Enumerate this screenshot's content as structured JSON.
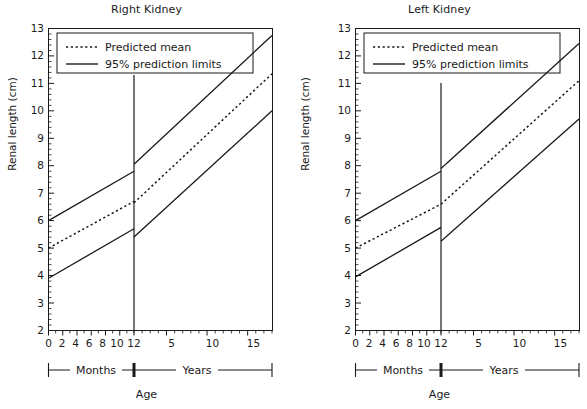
{
  "figure": {
    "xlabel": "Age",
    "ylabel": "Renal length (cm)",
    "bracket_left_label": "Months",
    "bracket_right_label": "Years"
  },
  "legend": {
    "mean_label": "Predicted mean",
    "limits_label": "95% prediction limits",
    "mean_style": "dotted",
    "limits_style": "solid",
    "color": "#1a1a1a"
  },
  "axis": {
    "y_ticks": [
      "13",
      "12",
      "11",
      "10",
      "9",
      "8",
      "7",
      "6",
      "5",
      "4",
      "3",
      "2"
    ],
    "x_ticks_months": [
      "0",
      "2",
      "4",
      "6",
      "8",
      "10",
      "12"
    ],
    "x_ticks_years": [
      "5",
      "10",
      "15"
    ]
  },
  "chart_data": [
    {
      "type": "line",
      "title": "Right Kidney",
      "xlabel": "Age",
      "ylabel": "Renal length (cm)",
      "ylim": [
        2,
        13
      ],
      "xlim_months": [
        0,
        12
      ],
      "xlim_years": [
        1,
        18
      ],
      "grid": false,
      "legend_position": "top-left",
      "annotations": [
        "Months",
        "Years"
      ],
      "series": [
        {
          "name": "95% upper prediction limit",
          "style": "solid",
          "points_months": [
            {
              "x": 0,
              "y": 6.0
            },
            {
              "x": 12,
              "y": 7.8
            }
          ],
          "points_years": [
            {
              "x": 1,
              "y": 8.05
            },
            {
              "x": 18,
              "y": 12.75
            }
          ]
        },
        {
          "name": "Predicted mean",
          "style": "dotted",
          "points_months": [
            {
              "x": 0,
              "y": 5.0
            },
            {
              "x": 12,
              "y": 6.7
            }
          ],
          "points_years": [
            {
              "x": 1,
              "y": 6.65
            },
            {
              "x": 18,
              "y": 11.35
            }
          ]
        },
        {
          "name": "95% lower prediction limit",
          "style": "solid",
          "points_months": [
            {
              "x": 0,
              "y": 3.9
            },
            {
              "x": 12,
              "y": 5.7
            }
          ],
          "points_years": [
            {
              "x": 1,
              "y": 5.4
            },
            {
              "x": 18,
              "y": 10.0
            }
          ]
        }
      ]
    },
    {
      "type": "line",
      "title": "Left Kidney",
      "xlabel": "Age",
      "ylabel": "Renal length (cm)",
      "ylim": [
        2,
        13
      ],
      "xlim_months": [
        0,
        12
      ],
      "xlim_years": [
        1,
        18
      ],
      "grid": false,
      "legend_position": "top-left",
      "annotations": [
        "Months",
        "Years"
      ],
      "series": [
        {
          "name": "95% upper prediction limit",
          "style": "solid",
          "points_months": [
            {
              "x": 0,
              "y": 6.0
            },
            {
              "x": 12,
              "y": 7.8
            }
          ],
          "points_years": [
            {
              "x": 1,
              "y": 7.9
            },
            {
              "x": 18,
              "y": 12.45
            }
          ]
        },
        {
          "name": "Predicted mean",
          "style": "dotted",
          "points_months": [
            {
              "x": 0,
              "y": 5.0
            },
            {
              "x": 12,
              "y": 6.6
            }
          ],
          "points_years": [
            {
              "x": 1,
              "y": 6.6
            },
            {
              "x": 18,
              "y": 11.1
            }
          ]
        },
        {
          "name": "95% lower prediction limit",
          "style": "solid",
          "points_months": [
            {
              "x": 0,
              "y": 3.95
            },
            {
              "x": 12,
              "y": 5.75
            }
          ],
          "points_years": [
            {
              "x": 1,
              "y": 5.25
            },
            {
              "x": 18,
              "y": 9.7
            }
          ]
        }
      ]
    }
  ]
}
